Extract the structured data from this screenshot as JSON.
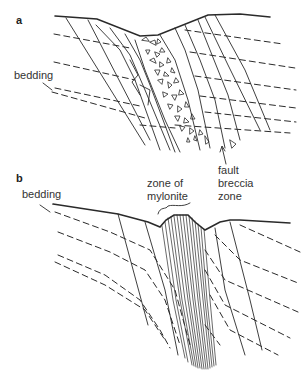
{
  "figure": {
    "panels": [
      {
        "id": "a",
        "letter": "a",
        "labels": {
          "bedding": "bedding",
          "fault_breccia_zone": [
            "fault",
            "breccia",
            "zone"
          ]
        },
        "description": "Cross-section showing fault breccia zone with angular fragments between fault strands, bedding shown as dashed lines"
      },
      {
        "id": "b",
        "letter": "b",
        "labels": {
          "bedding": "bedding",
          "zone_of_mylonite": [
            "zone of",
            "mylonite"
          ]
        },
        "description": "Cross-section showing zone of mylonite with dense sub-parallel fault lines, bedding dragged near the fault zone"
      }
    ],
    "colors": {
      "line": "#2a2a2a",
      "background": "#ffffff"
    }
  }
}
